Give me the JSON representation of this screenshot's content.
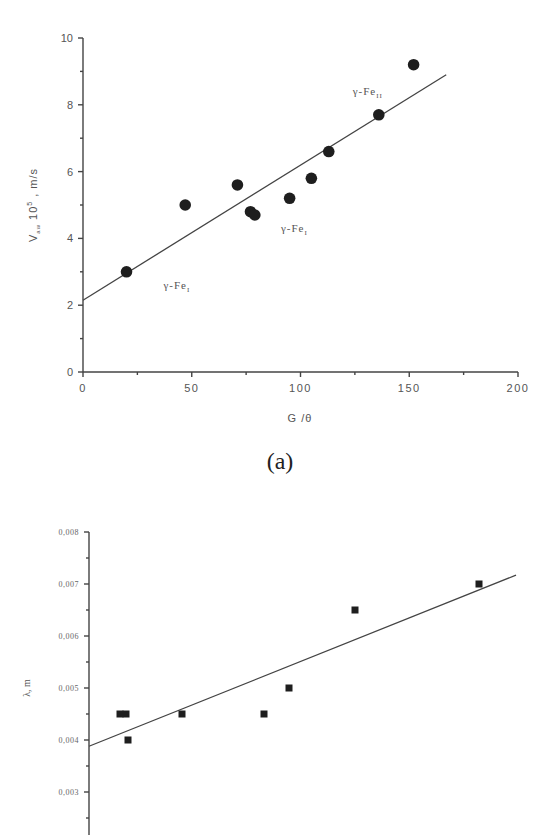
{
  "caption": "(a)",
  "chart_data": [
    {
      "type": "scatter",
      "title": "",
      "xlabel": "G /θ",
      "ylabel": "V_aw 10^5 , m/s",
      "ylabel_parts": {
        "main": "V",
        "sub": "aw",
        "mid": " 10",
        "sup": "5",
        "unit": " , m/s"
      },
      "xlim": [
        0,
        200
      ],
      "ylim": [
        0,
        10
      ],
      "x_ticks": [
        "0",
        "50",
        "100",
        "150",
        "200"
      ],
      "y_ticks": [
        "0",
        "2",
        "4",
        "6",
        "8",
        "10"
      ],
      "grid": false,
      "marker": "circle",
      "series": [
        {
          "name": "data",
          "x": [
            20,
            47,
            71,
            77,
            79,
            95,
            105,
            113,
            136,
            152
          ],
          "y": [
            3.0,
            5.0,
            5.6,
            4.8,
            4.7,
            5.2,
            5.8,
            6.6,
            7.7,
            9.2
          ]
        }
      ],
      "fit_line": {
        "x": [
          0,
          167
        ],
        "y": [
          2.15,
          8.9
        ]
      },
      "annotations": [
        {
          "text": "γ-Fe",
          "sub": "I",
          "x": 37,
          "y": 2.5
        },
        {
          "text": "γ-Fe",
          "sub": "I",
          "x": 91,
          "y": 4.2
        },
        {
          "text": "γ-Fe",
          "sub": "II",
          "x": 124,
          "y": 8.3
        }
      ]
    },
    {
      "type": "scatter",
      "title": "",
      "xlabel": "",
      "ylabel": "λ, m",
      "ylim": [
        0.002,
        0.008
      ],
      "y_ticks": [
        "0,003",
        "0,004",
        "0,005",
        "0,006",
        "0,007",
        "0,008"
      ],
      "grid": false,
      "marker": "square",
      "series": [
        {
          "name": "data",
          "px_x": [
            120,
            126,
            128,
            182,
            264,
            289,
            355,
            479
          ],
          "y": [
            0.0045,
            0.0045,
            0.004,
            0.0045,
            0.0045,
            0.005,
            0.0065,
            0.007
          ]
        }
      ],
      "fit_line": {
        "px_x": [
          89,
          516
        ],
        "y": [
          0.00388,
          0.00717
        ]
      }
    }
  ]
}
